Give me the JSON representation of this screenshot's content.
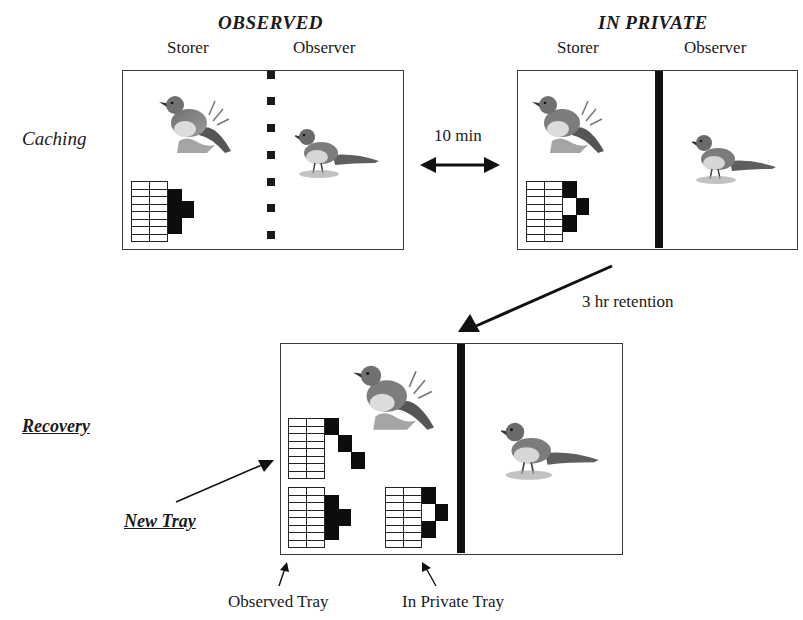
{
  "conditions": {
    "observed": {
      "title": "OBSERVED",
      "storer_label": "Storer",
      "observer_label": "Observer",
      "divider": "dashed"
    },
    "in_private": {
      "title": "IN PRIVATE",
      "storer_label": "Storer",
      "observer_label": "Observer",
      "divider": "solid"
    }
  },
  "phases": {
    "caching": {
      "label": "Caching"
    },
    "recovery": {
      "label": "Recovery"
    }
  },
  "transitions": {
    "between_conditions": {
      "label": "10 min",
      "arrow": "double-headed-horizontal"
    },
    "to_recovery": {
      "label": "3 hr retention",
      "arrow": "diagonal-down-left"
    }
  },
  "recovery_trays": {
    "new_tray": {
      "label": "New Tray"
    },
    "observed_tray": {
      "label": "Observed Tray"
    },
    "in_private_tray": {
      "label": "In Private Tray"
    }
  },
  "tray_grid": {
    "columns": 2,
    "rows": 8,
    "cache_column_pattern": {
      "observed": "rows 2-6 filled, extra cell to right at rows 3-4",
      "in_private": "rows 1-2 filled, hole at rows 3-4 with cell to right, rows 5-6 filled",
      "new": "diagonal staircase of 3 filled cells"
    }
  },
  "colors": {
    "ink": "#111111",
    "border": "#3a3a3a",
    "bird_body": "#8a8a8a",
    "bird_breast": "#d9d9d9"
  }
}
